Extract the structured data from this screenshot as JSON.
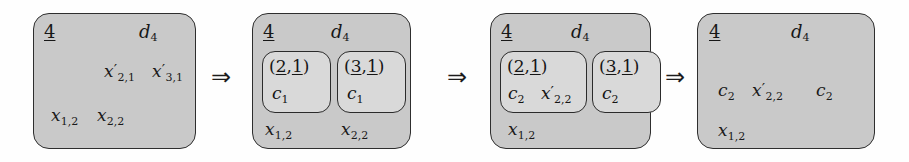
{
  "diagram": {
    "arrow_glyph": "⇒",
    "colors": {
      "outer_box_fill": "#c9c9c9",
      "inner_box_fill": "#d9d9d9",
      "border": "#2e2e2e",
      "text": "#1a1a1a",
      "page_background": "#fefefe"
    },
    "arrows": [
      {
        "name": "arrow-1-2",
        "glyph": "⇒"
      },
      {
        "name": "arrow-2-3",
        "glyph": "⇒"
      },
      {
        "name": "arrow-3-4",
        "glyph": "⇒"
      }
    ],
    "states": [
      {
        "id": "state-1",
        "corner_index": "4",
        "header_label": {
          "base": "d",
          "sub": "4"
        },
        "inner_cells": [],
        "free_terms_upper": [
          {
            "base": "x",
            "prime": true,
            "sub": "2,1"
          },
          {
            "base": "x",
            "prime": true,
            "sub": "3,1"
          }
        ],
        "free_terms_lower": [
          {
            "base": "x",
            "prime": false,
            "sub": "1,2"
          },
          {
            "base": "x",
            "prime": false,
            "sub": "2,2"
          }
        ]
      },
      {
        "id": "state-2",
        "corner_index": "4",
        "header_label": {
          "base": "d",
          "sub": "4"
        },
        "inner_cells": [
          {
            "pair": {
              "open": "(",
              "first": "2",
              "comma": ",",
              "second": "1",
              "close": ")",
              "first_underlined": true,
              "second_underlined": true
            },
            "contents": [
              {
                "base": "c",
                "prime": false,
                "sub": "1"
              }
            ]
          },
          {
            "pair": {
              "open": "(",
              "first": "3",
              "comma": ",",
              "second": "1",
              "close": ")",
              "first_underlined": true,
              "second_underlined": true
            },
            "contents": [
              {
                "base": "c",
                "prime": false,
                "sub": "1"
              }
            ]
          }
        ],
        "free_terms_upper": [],
        "free_terms_lower": [
          {
            "base": "x",
            "prime": false,
            "sub": "1,2"
          },
          {
            "base": "x",
            "prime": false,
            "sub": "2,2"
          }
        ]
      },
      {
        "id": "state-3",
        "corner_index": "4",
        "header_label": {
          "base": "d",
          "sub": "4"
        },
        "inner_cells": [
          {
            "pair": {
              "open": "(",
              "first": "2",
              "comma": ",",
              "second": "1",
              "close": ")",
              "first_underlined": true,
              "second_underlined": true
            },
            "contents": [
              {
                "base": "c",
                "prime": false,
                "sub": "2"
              },
              {
                "base": "x",
                "prime": true,
                "sub": "2,2"
              }
            ]
          },
          {
            "pair": {
              "open": "(",
              "first": "3",
              "comma": ",",
              "second": "1",
              "close": ")",
              "first_underlined": true,
              "second_underlined": true
            },
            "contents": [
              {
                "base": "c",
                "prime": false,
                "sub": "2"
              }
            ]
          }
        ],
        "free_terms_upper": [],
        "free_terms_lower": [
          {
            "base": "x",
            "prime": false,
            "sub": "1,2"
          }
        ]
      },
      {
        "id": "state-4",
        "corner_index": "4",
        "header_label": {
          "base": "d",
          "sub": "4"
        },
        "inner_cells": [],
        "free_terms_upper": [
          {
            "base": "c",
            "prime": false,
            "sub": "2"
          },
          {
            "base": "x",
            "prime": true,
            "sub": "2,2"
          },
          {
            "base": "c",
            "prime": false,
            "sub": "2"
          }
        ],
        "free_terms_lower": [
          {
            "base": "x",
            "prime": false,
            "sub": "1,2"
          }
        ]
      }
    ],
    "rendered_text": {
      "s1_index": "4",
      "s1_header": "d4",
      "s1_x21p": "x'2,1",
      "s1_x31p": "x'3,1",
      "s1_x12": "x1,2",
      "s1_x22": "x2,2",
      "s2_index": "4",
      "s2_header": "d4",
      "s2_cell1_pair": "(2,1)",
      "s2_cell1_c": "c1",
      "s2_cell2_pair": "(3,1)",
      "s2_cell2_c": "c1",
      "s2_x12": "x1,2",
      "s2_x22": "x2,2",
      "s3_index": "4",
      "s3_header": "d4",
      "s3_cell1_pair": "(2,1)",
      "s3_cell1_c": "c2",
      "s3_cell1_x": "x'2,2",
      "s3_cell2_pair": "(3,1)",
      "s3_cell2_c": "c2",
      "s3_x12": "x1,2",
      "s4_index": "4",
      "s4_header": "d4",
      "s4_c2_a": "c2",
      "s4_x22p": "x'2,2",
      "s4_c2_b": "c2",
      "s4_x12": "x1,2"
    }
  }
}
